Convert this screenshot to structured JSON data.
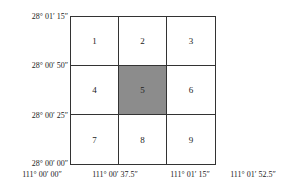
{
  "diagram": {
    "cells": [
      {
        "label": "1",
        "shaded": false
      },
      {
        "label": "2",
        "shaded": false
      },
      {
        "label": "3",
        "shaded": false
      },
      {
        "label": "4",
        "shaded": false
      },
      {
        "label": "5",
        "shaded": true
      },
      {
        "label": "6",
        "shaded": false
      },
      {
        "label": "7",
        "shaded": false
      },
      {
        "label": "8",
        "shaded": false
      },
      {
        "label": "9",
        "shaded": false
      }
    ],
    "y_labels": [
      "28°  01′  15″",
      "28°  00′  50″",
      "28°  00′  25″",
      "28°  00′  00″"
    ],
    "x_labels": [
      "111°  00′  00″",
      "111°  00′  37.5″",
      "111°  01′  15″",
      "111°  01′  52.5″"
    ],
    "shade_color": "#8c8c8c"
  }
}
